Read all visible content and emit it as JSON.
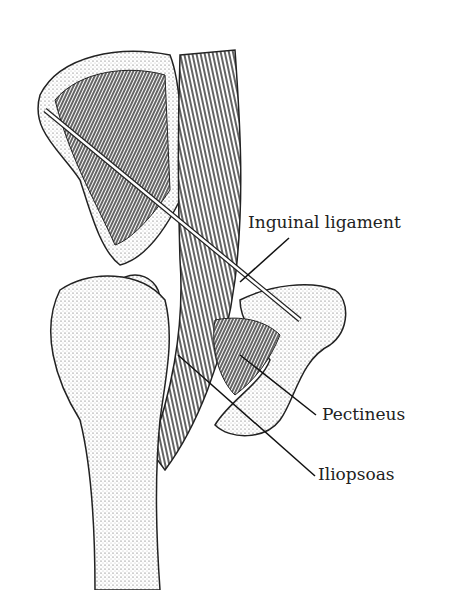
{
  "diagram": {
    "labels": [
      {
        "text": "Inguinal ligament"
      },
      {
        "text": "Pectineus"
      },
      {
        "text": "Iliopsoas"
      }
    ]
  }
}
